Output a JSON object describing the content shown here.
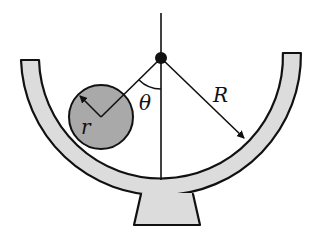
{
  "diagram": {
    "labels": {
      "small_radius": "r",
      "angle": "θ",
      "large_radius": "R"
    },
    "colors": {
      "bowl_fill": "#dcdcdc",
      "ball_fill": "#a9a9a9",
      "stroke": "#111111",
      "background": "#ffffff"
    }
  }
}
